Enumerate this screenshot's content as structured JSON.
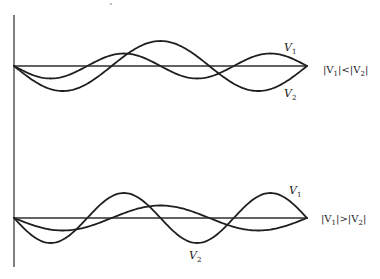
{
  "diagram": {
    "panels": [
      {
        "id": "top",
        "condition_label": "|V1|<|V2|",
        "condition_parts": [
          "|V",
          "1",
          "|<|V",
          "2",
          "|"
        ],
        "waves": [
          {
            "name": "V1",
            "label_main": "V",
            "label_sub": "1",
            "half_waves": 4,
            "relative_amplitude": 0.5,
            "sign": -1,
            "label_position": "upper-right"
          },
          {
            "name": "V2",
            "label_main": "V",
            "label_sub": "2",
            "half_waves": 3,
            "relative_amplitude": 1.0,
            "sign": -1,
            "label_position": "lower-right"
          }
        ]
      },
      {
        "id": "bottom",
        "condition_label": "|V1|>|V2|",
        "condition_parts": [
          "|V",
          "1",
          "|>|V",
          "2",
          "|"
        ],
        "waves": [
          {
            "name": "V1",
            "label_main": "V",
            "label_sub": "1",
            "half_waves": 4,
            "relative_amplitude": 1.0,
            "sign": -1,
            "label_position": "upper-right"
          },
          {
            "name": "V2",
            "label_main": "V",
            "label_sub": "2",
            "half_waves": 3,
            "relative_amplitude": 0.5,
            "sign": -1,
            "label_position": "lower-middle"
          }
        ]
      }
    ]
  }
}
